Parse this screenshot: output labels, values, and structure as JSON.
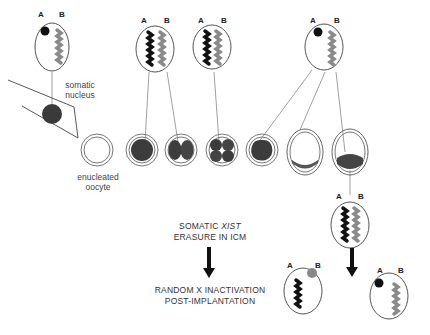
{
  "labels": {
    "somatic_nucleus": [
      "somatic",
      "nucleus"
    ],
    "enucleated_oocyte": [
      "enucleated",
      "oocyte"
    ],
    "caption_xist_line1_prefix": "SOMATIC ",
    "caption_xist_line1_italic": "XIST",
    "caption_xist_line2": "ERASURE IN ICM",
    "caption_random_line1": "RANDOM X INACTIVATION",
    "caption_random_line2": "POST-IMPLANTATION"
  },
  "chromosome_labels": {
    "a": "A",
    "b": "B"
  },
  "stages": [
    "enucleated oocyte",
    "1-cell",
    "2-cell",
    "4-cell",
    "morula",
    "early blastocyst",
    "blastocyst"
  ],
  "nuclei": [
    {
      "id": "somatic",
      "state": "A inactive (Xi body), B active"
    },
    {
      "id": "2cell",
      "state": "A and B both active"
    },
    {
      "id": "4cell",
      "state": "A and B both active"
    },
    {
      "id": "blastocyst",
      "state": "A inactive (Xi body), B active"
    },
    {
      "id": "icm",
      "state": "A and B both active"
    },
    {
      "id": "post_left",
      "state": "A active, B inactive"
    },
    {
      "id": "post_right",
      "state": "A inactive, B active"
    }
  ],
  "colors": {
    "active_a": "#111111",
    "active_b": "#8a8a8a",
    "outline": "#555555"
  }
}
